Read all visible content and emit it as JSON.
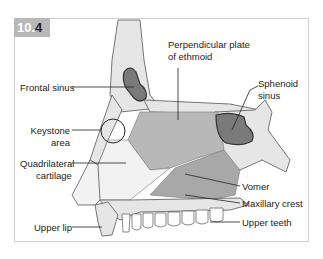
{
  "figure": {
    "number_prefix": "10.",
    "number_suffix": "4"
  },
  "labels": {
    "perpendicular_plate_line1": "Perpendicular plate",
    "perpendicular_plate_line2": "of ethmoid",
    "frontal_sinus": "Frontal sinus",
    "sphenoid_sinus_line1": "Sphenoid",
    "sphenoid_sinus_line2": "sinus",
    "keystone_line1": "Keystone",
    "keystone_line2": "area",
    "quadrilateral_line1": "Quadrilateral",
    "quadrilateral_line2": "cartilage",
    "vomer": "Vomer",
    "maxillary_crest": "Maxillary crest",
    "upper_lip": "Upper lip",
    "upper_teeth": "Upper teeth"
  },
  "colors": {
    "bone": "#e6e6e6",
    "septum_bone": "#b5b5b5",
    "vomer": "#a8a8a8",
    "cartilage": "#f2f2f2",
    "sinus": "#7a7a7a",
    "outline": "#555555",
    "badge": "#b8b8b8"
  }
}
